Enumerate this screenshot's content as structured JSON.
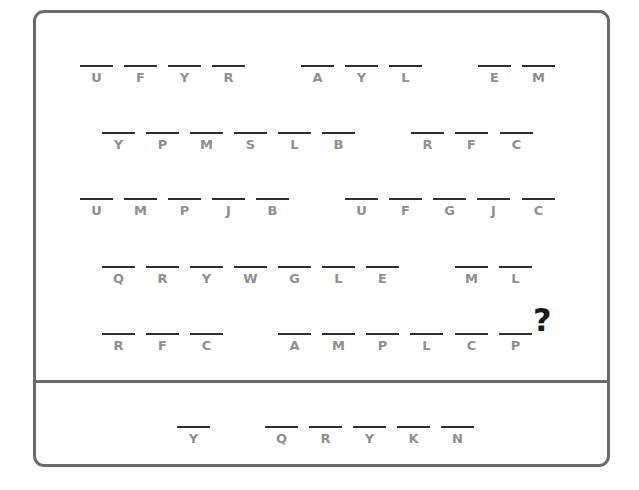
{
  "puzzle": {
    "question_mark": "?",
    "rows": [
      {
        "y": 65,
        "groups": [
          {
            "letters": [
              "U",
              "F",
              "Y",
              "R"
            ],
            "x": [
              80,
              124,
              168,
              212
            ]
          },
          {
            "letters": [
              "A",
              "Y",
              "L"
            ],
            "x": [
              301,
              345,
              389
            ]
          },
          {
            "letters": [
              "E",
              "M"
            ],
            "x": [
              478,
              522
            ]
          }
        ]
      },
      {
        "y": 132,
        "groups": [
          {
            "letters": [
              "Y",
              "P",
              "M",
              "S",
              "L",
              "B"
            ],
            "x": [
              102,
              146,
              190,
              234,
              278,
              322
            ]
          },
          {
            "letters": [
              "R",
              "F",
              "C"
            ],
            "x": [
              411,
              455,
              500
            ]
          }
        ]
      },
      {
        "y": 198,
        "groups": [
          {
            "letters": [
              "U",
              "M",
              "P",
              "J",
              "B"
            ],
            "x": [
              80,
              124,
              168,
              212,
              256
            ]
          },
          {
            "letters": [
              "U",
              "F",
              "G",
              "J",
              "C"
            ],
            "x": [
              345,
              389,
              433,
              477,
              522
            ]
          }
        ]
      },
      {
        "y": 266,
        "groups": [
          {
            "letters": [
              "Q",
              "R",
              "Y",
              "W",
              "G",
              "L",
              "E"
            ],
            "x": [
              102,
              146,
              190,
              234,
              278,
              322,
              366
            ]
          },
          {
            "letters": [
              "M",
              "L"
            ],
            "x": [
              455,
              499
            ]
          }
        ]
      },
      {
        "y": 333,
        "groups": [
          {
            "letters": [
              "R",
              "F",
              "C"
            ],
            "x": [
              102,
              146,
              190
            ]
          },
          {
            "letters": [
              "A",
              "M",
              "P",
              "L",
              "C",
              "P"
            ],
            "x": [
              278,
              322,
              366,
              410,
              455,
              499
            ]
          }
        ]
      }
    ]
  },
  "answer": {
    "y": 426,
    "groups": [
      {
        "letters": [
          "Y"
        ],
        "x": [
          177
        ]
      },
      {
        "letters": [
          "Q",
          "R",
          "Y",
          "K",
          "N"
        ],
        "x": [
          265,
          309,
          353,
          397,
          441
        ]
      }
    ]
  },
  "colors": {
    "border": "#6b6b6b",
    "dash": "#2e2e2e",
    "letter": "#8f8f8f",
    "qmark": "#1a1a1a"
  }
}
